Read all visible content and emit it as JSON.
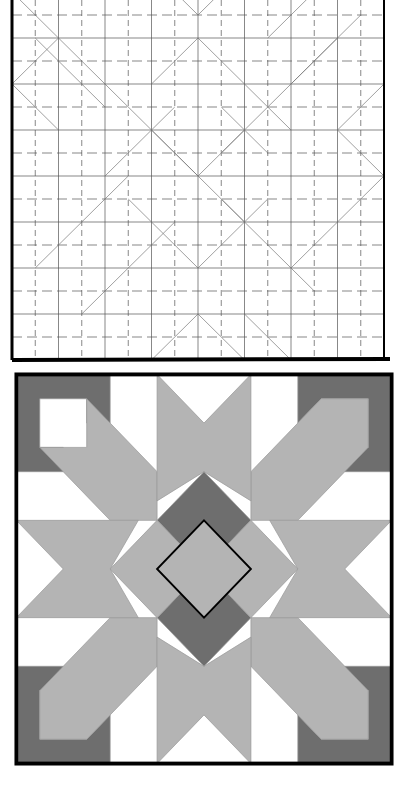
{
  "figure": {
    "top_panel": {
      "label": "quilt-block-grid-pattern",
      "grid_cells": 16,
      "line_color": "#555555",
      "border_color": "#000000"
    },
    "bottom_panel": {
      "label": "quilt-block-colored",
      "grid_units": 8,
      "colors": {
        "dark": "#6e6e6e",
        "light": "#b4b4b4",
        "background": "#ffffff",
        "border": "#000000"
      }
    },
    "side_caption": ""
  }
}
